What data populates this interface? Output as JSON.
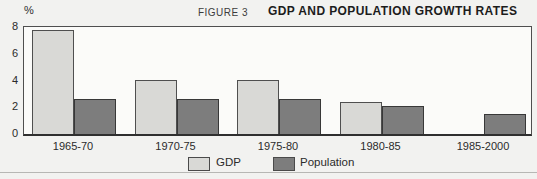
{
  "header": {
    "unit_label": "%",
    "figure_label": "FIGURE 3",
    "title": "GDP AND POPULATION GROWTH RATES"
  },
  "chart_data": {
    "type": "bar",
    "categories": [
      "1965-70",
      "1970-75",
      "1975-80",
      "1980-85",
      "1985-2000"
    ],
    "series": [
      {
        "name": "GDP",
        "color": "#d9d9d6",
        "border_color": "#4f4f4f",
        "values": [
          7.8,
          4.0,
          4.0,
          2.4,
          null
        ]
      },
      {
        "name": "Population",
        "color": "#7d7d7d",
        "border_color": "#383838",
        "values": [
          2.6,
          2.6,
          2.6,
          2.1,
          1.5
        ]
      }
    ],
    "title": "GDP AND POPULATION GROWTH RATES",
    "xlabel": "",
    "ylabel": "%",
    "ylim": [
      0,
      8
    ],
    "yticks": [
      0,
      2,
      4,
      6,
      8
    ],
    "grid": false,
    "legend_position": "bottom"
  }
}
